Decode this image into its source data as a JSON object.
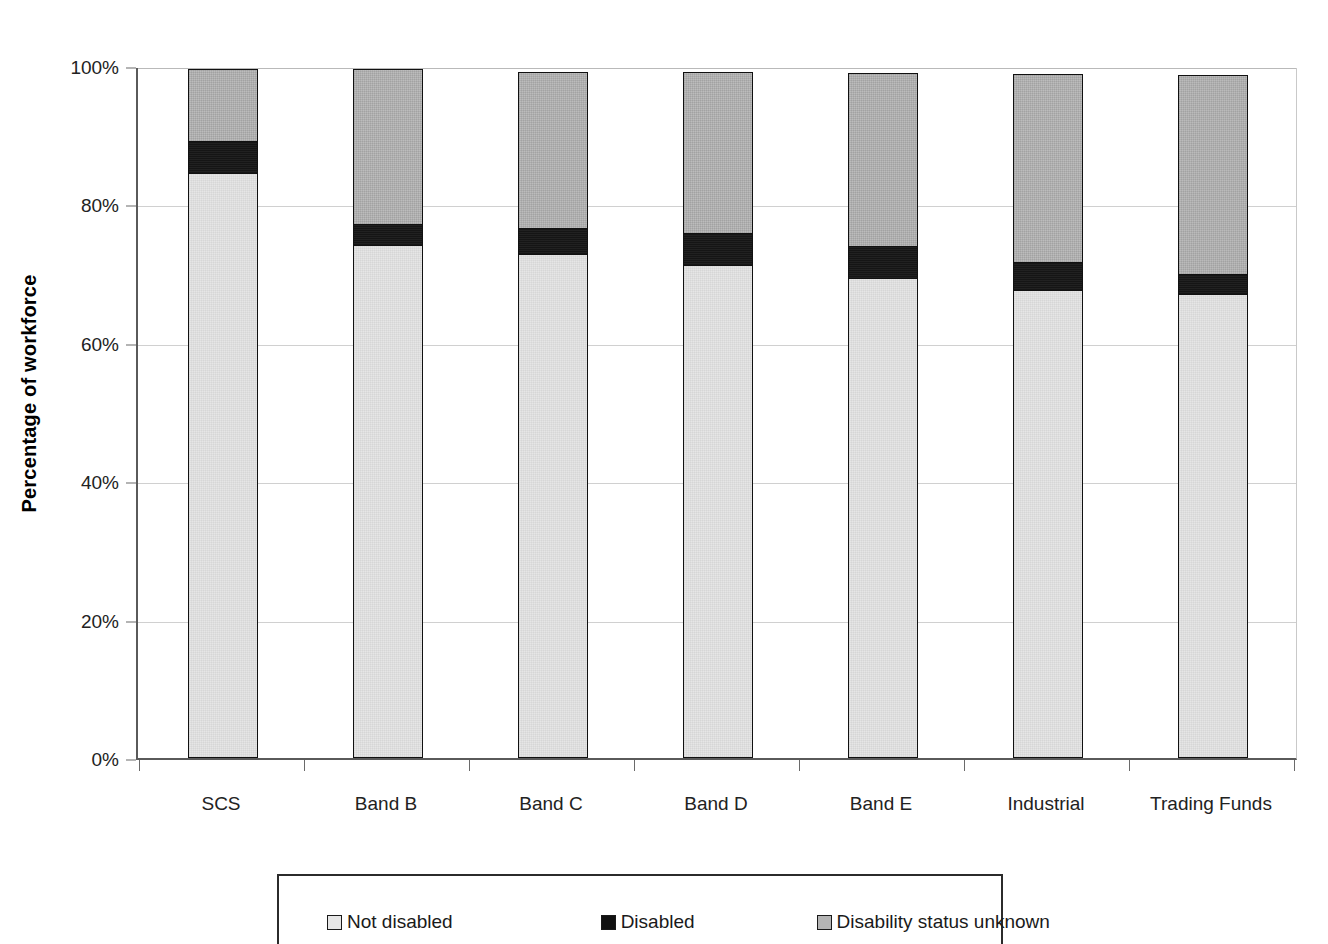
{
  "chart_data": {
    "type": "bar",
    "subtype": "stacked-100-percent",
    "title": "",
    "xlabel": "",
    "ylabel": "Percentage of workforce",
    "categories": [
      "SCS",
      "Band B",
      "Band C",
      "Band D",
      "Band E",
      "Industrial",
      "Trading Funds"
    ],
    "series": [
      {
        "name": "Not disabled",
        "color": "#e6e6e6",
        "values": [
          84.5,
          74.1,
          72.8,
          71.2,
          69.4,
          67.6,
          67.0
        ]
      },
      {
        "name": "Disabled",
        "color": "#151515",
        "values": [
          4.9,
          3.3,
          4.0,
          4.9,
          4.8,
          4.3,
          3.2
        ]
      },
      {
        "name": "Disability status unknown",
        "color": "#b4b4b4",
        "values": [
          10.6,
          22.6,
          22.8,
          23.5,
          25.3,
          27.4,
          28.9
        ]
      }
    ],
    "totals": [
      100.0,
      100.0,
      99.6,
      99.6,
      99.5,
      99.3,
      99.1
    ],
    "ylim": [
      0,
      100
    ],
    "yticks": [
      0,
      20,
      40,
      60,
      80,
      100
    ],
    "ytick_labels": [
      "0%",
      "20%",
      "40%",
      "60%",
      "80%",
      "100%"
    ],
    "grid": "horizontal",
    "legend_position": "bottom"
  },
  "axis": {
    "y_title": "Percentage of workforce",
    "y_tick_labels": [
      "0%",
      "20%",
      "40%",
      "60%",
      "80%",
      "100%"
    ],
    "x_tick_labels": [
      "SCS",
      "Band B",
      "Band C",
      "Band D",
      "Band E",
      "Industrial",
      "Trading Funds"
    ]
  },
  "legend": {
    "items": [
      {
        "label": "Not disabled",
        "swatch": "swatch-not-disabled"
      },
      {
        "label": "Disabled",
        "swatch": "swatch-disabled"
      },
      {
        "label": "Disability status unknown",
        "swatch": "swatch-unknown"
      }
    ]
  },
  "colors": {
    "not_disabled": "#e6e6e6",
    "disabled": "#151515",
    "unknown": "#b4b4b4",
    "axis": "#5a5a5a",
    "gridline": "#d0d0d0"
  }
}
